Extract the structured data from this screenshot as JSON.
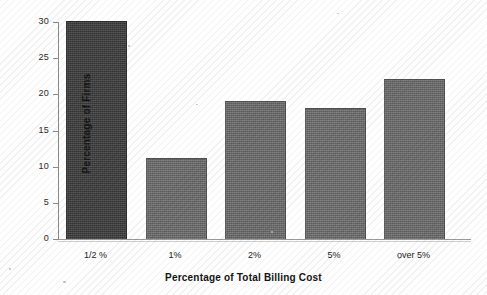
{
  "chart_data": {
    "type": "bar",
    "title": "",
    "categories": [
      "1/2 %",
      "1%",
      "2%",
      "5%",
      "over 5%"
    ],
    "values": [
      30,
      11,
      19,
      18,
      22
    ],
    "xlabel": "Percentage of Total Billing Cost",
    "ylabel": "Percentage of Firms",
    "ylim": [
      0,
      30
    ],
    "yticks": [
      0,
      5,
      10,
      15,
      20,
      25,
      30
    ],
    "ytick_labels": [
      "0",
      "5",
      "10",
      "15",
      "20",
      "25",
      "30"
    ],
    "grid": false,
    "legend": false,
    "bar_colors": [
      "#3d3d3d",
      "#6e6e6e",
      "#6e6e6e",
      "#707070",
      "#6e6e6e"
    ],
    "axis_color": "#8a8a8a"
  }
}
